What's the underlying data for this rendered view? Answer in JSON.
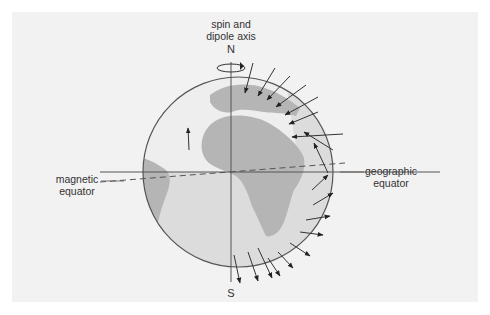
{
  "figure": {
    "title_fragment": "",
    "labels": {
      "axis_line1": "spin and",
      "axis_line2": "dipole axis",
      "north": "N",
      "south": "S",
      "magnetic_line1": "magnetic",
      "magnetic_line2": "equator",
      "geographic_line1": "geographic",
      "geographic_line2": "equator"
    },
    "colors": {
      "panel": "#f2f2f2",
      "ocean_light": "#eeeeee",
      "ocean_shade": "#dadada",
      "land": "#b5b5b5",
      "line": "#444444"
    },
    "field_arrows": {
      "northern_hemisphere": "inward",
      "southern_hemisphere": "outward",
      "count_north": 9,
      "count_south": 10
    }
  }
}
